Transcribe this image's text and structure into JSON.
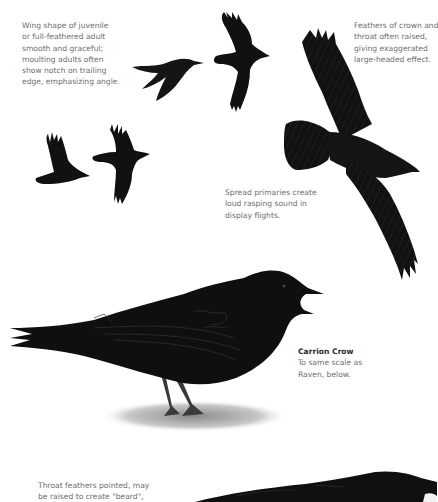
{
  "page": {
    "type": "field-guide-plate"
  },
  "annotations": {
    "wing_shape": {
      "lines": [
        "Wing shape of juvenile",
        "or full-feathered adult",
        "smooth and graceful;",
        "moulting adults often",
        "show notch on trailing",
        "edge, emphasizing angle."
      ]
    },
    "crown_feathers": {
      "lines": [
        "Feathers of crown and",
        "throat often raised,",
        "giving exaggerated",
        "large-headed effect."
      ]
    },
    "spread_primaries": {
      "lines": [
        "Spread primaries create",
        "loud rasping sound in",
        "display flights."
      ]
    },
    "carrion_crow": {
      "title": "Carrion Crow",
      "lines": [
        "To same scale as",
        "Raven, below."
      ]
    },
    "throat_feathers": {
      "lines": [
        "Throat feathers pointed, may",
        "be raised to create \"beard\","
      ]
    }
  },
  "illustrations": [
    {
      "name": "crow-gliding-side",
      "label": "Flying crow, side view gliding"
    },
    {
      "name": "crow-flying-upstroke",
      "label": "Flying crow, wings raised"
    },
    {
      "name": "crow-flying-small-left",
      "label": "Flying crow, small, wings up"
    },
    {
      "name": "crow-flying-small-right",
      "label": "Flying crow, small, wings down"
    },
    {
      "name": "crow-soaring-large",
      "label": "Large soaring crow from below, tail fanned"
    },
    {
      "name": "carrion-crow-perched",
      "label": "Carrion Crow perched, calling"
    },
    {
      "name": "raven-head-partial",
      "label": "Raven head and back, partially visible"
    }
  ],
  "colors": {
    "background": "#ffffff",
    "text": "#6e6e6e",
    "title": "#2a2a2a",
    "bird": "#111111",
    "feather_edge": "#3a3a3a",
    "ground": "#9a9a9a"
  }
}
